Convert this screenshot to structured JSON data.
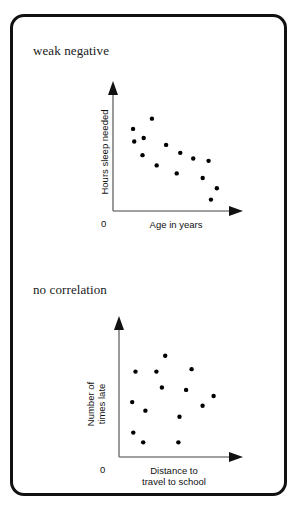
{
  "figure": {
    "background_color": "#ffffff",
    "border_color": "#111111",
    "axis_color": "#808080",
    "point_color": "#000000"
  },
  "chart_data": [
    {
      "type": "scatter",
      "title": "weak negative",
      "xlabel": "Age in years",
      "ylabel": "Hours sleep needed",
      "origin_label": "0",
      "xlim": [
        0,
        100
      ],
      "ylim": [
        0,
        100
      ],
      "grid": false,
      "legend": "none",
      "axis_style": "arrow",
      "points": [
        {
          "x": 17,
          "y": 72
        },
        {
          "x": 33,
          "y": 81
        },
        {
          "x": 18,
          "y": 61
        },
        {
          "x": 26,
          "y": 64
        },
        {
          "x": 25,
          "y": 49
        },
        {
          "x": 45,
          "y": 58
        },
        {
          "x": 57,
          "y": 51
        },
        {
          "x": 37,
          "y": 40
        },
        {
          "x": 54,
          "y": 33
        },
        {
          "x": 68,
          "y": 46
        },
        {
          "x": 81,
          "y": 44
        },
        {
          "x": 76,
          "y": 29
        },
        {
          "x": 88,
          "y": 20
        },
        {
          "x": 83,
          "y": 10
        }
      ]
    },
    {
      "type": "scatter",
      "title": "no correlation",
      "xlabel_lines": [
        "Distance to",
        "travel to school"
      ],
      "ylabel_lines": [
        "Number of",
        "times late"
      ],
      "origin_label": "0",
      "xlim": [
        0,
        100
      ],
      "ylim": [
        0,
        100
      ],
      "grid": false,
      "legend": "none",
      "axis_style": "arrow",
      "points": [
        {
          "x": 42,
          "y": 83
        },
        {
          "x": 15,
          "y": 70
        },
        {
          "x": 34,
          "y": 70
        },
        {
          "x": 66,
          "y": 72
        },
        {
          "x": 39,
          "y": 57
        },
        {
          "x": 61,
          "y": 55
        },
        {
          "x": 86,
          "y": 50
        },
        {
          "x": 12,
          "y": 45
        },
        {
          "x": 76,
          "y": 42
        },
        {
          "x": 24,
          "y": 38
        },
        {
          "x": 55,
          "y": 33
        },
        {
          "x": 13,
          "y": 20
        },
        {
          "x": 22,
          "y": 12
        },
        {
          "x": 54,
          "y": 12
        }
      ]
    }
  ]
}
